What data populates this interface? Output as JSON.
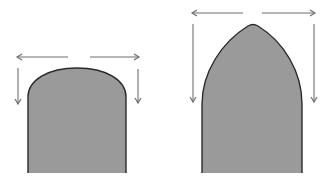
{
  "diagram": {
    "description": "Comparison of a round arch and a pointed arch with lateral (horizontal) and vertical thrust arrows",
    "colors": {
      "background": "#ffffff",
      "fill": "#9a9a9a",
      "outline": "#2a2a2a",
      "arrow": "#6e6e6e"
    },
    "figures": [
      {
        "name": "round-arch",
        "label": "Round arch",
        "horizontal_thrust": "large",
        "vertical_thrust": "short"
      },
      {
        "name": "pointed-arch",
        "label": "Pointed arch",
        "horizontal_thrust": "small",
        "vertical_thrust": "long"
      }
    ]
  }
}
